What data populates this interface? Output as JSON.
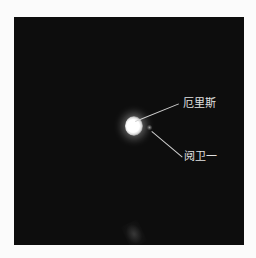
{
  "image": {
    "subject": "Planet with moon, telescope image",
    "background_color": "#0d0d0d"
  },
  "annotations": [
    {
      "label": "厄里斯",
      "target": "planet"
    },
    {
      "label": "阋卫一",
      "target": "moon"
    }
  ]
}
